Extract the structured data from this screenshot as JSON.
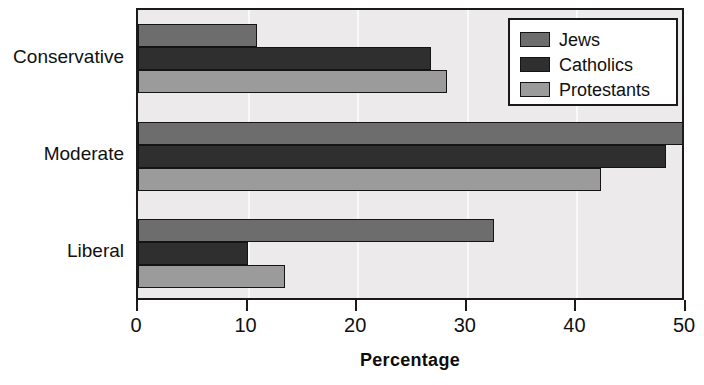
{
  "chart_data": {
    "type": "bar",
    "orientation": "horizontal",
    "title": "",
    "xlabel": "Percentage",
    "ylabel": "",
    "xlim": [
      0,
      50
    ],
    "xticks": [
      0,
      10,
      20,
      30,
      40,
      50
    ],
    "xticklabels": [
      "0",
      "10",
      "20",
      "30",
      "40",
      "50"
    ],
    "categories": [
      "Conservative",
      "Moderate",
      "Liberal"
    ],
    "grid": true,
    "legend_position": "top-right",
    "series": [
      {
        "name": "Jews",
        "color": "#6d6d6d",
        "values": [
          10.9,
          50.0,
          32.5
        ]
      },
      {
        "name": "Catholics",
        "color": "#2f2f2f",
        "values": [
          26.7,
          48.2,
          10.0
        ]
      },
      {
        "name": "Protestants",
        "color": "#9b9b9b",
        "values": [
          28.2,
          42.2,
          13.4
        ]
      }
    ]
  },
  "legend": {
    "entries": [
      {
        "label": "Jews"
      },
      {
        "label": "Catholics"
      },
      {
        "label": "Protestants"
      }
    ]
  },
  "colors": {
    "plot_background": "#eceaea",
    "axis": "#1a1a1a",
    "gridline": "#fbfbfb",
    "text": "#101010",
    "jews": "#6d6d6d",
    "catholics": "#2f2f2f",
    "protestants": "#9b9b9b"
  }
}
